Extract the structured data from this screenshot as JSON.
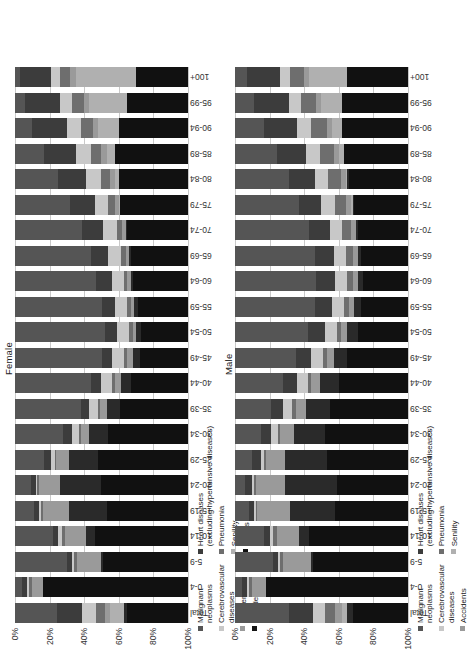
{
  "figure": {
    "panels": [
      {
        "id": "female",
        "title": "Female",
        "yticks": [
          "0%",
          "20%",
          "40%",
          "60%",
          "80%",
          "100%"
        ]
      },
      {
        "id": "male",
        "title": "Male",
        "yticks": [
          "0%",
          "20%",
          "40%",
          "60%",
          "80%",
          "100%"
        ]
      }
    ]
  },
  "legend": {
    "female": {
      "col1": [
        {
          "label": "Malignant\nneoplasms",
          "color": "#555555"
        },
        {
          "label": "Cerebrovascular\ndiseases",
          "color": "#c8c8c8"
        },
        {
          "label": "Accidents",
          "color": "#9a9a9a"
        },
        {
          "label": "Suicide",
          "color": "#141414"
        }
      ],
      "col2": [
        {
          "label": "Heart diseases\n(excluding hypertensive diseases)",
          "color": "#3c3c3c"
        },
        {
          "label": "Pneumonia",
          "color": "#6e6e6e"
        },
        {
          "label": "Senility",
          "color": "#b0b0b0"
        },
        {
          "label": "Others",
          "color": "#111111"
        }
      ]
    },
    "male": {
      "col1": [
        {
          "label": "Malignant\nneoplasms",
          "color": "#555555"
        },
        {
          "label": "Cerebrovascular\ndiseases",
          "color": "#c8c8c8"
        },
        {
          "label": "Accidents",
          "color": "#9a9a9a"
        }
      ],
      "col2": [
        {
          "label": "Heart diseases\n(excluding hypertensive diseases)",
          "color": "#3c3c3c"
        },
        {
          "label": "Pneumonia",
          "color": "#6e6e6e"
        },
        {
          "label": "Senility",
          "color": "#b0b0b0"
        }
      ]
    }
  },
  "chart_data": {
    "type": "bar",
    "subtype": "stacked-percentage",
    "orientation": "vertical-rotated",
    "xlabel": "",
    "ylabel": "",
    "ylim": [
      0,
      100
    ],
    "grid": true,
    "legend_position": "bottom-left",
    "categories": [
      "Total",
      "0-4",
      "5-9",
      "10-14",
      "15-19",
      "20-24",
      "25-29",
      "30-34",
      "35-39",
      "40-44",
      "45-49",
      "50-54",
      "55-59",
      "60-64",
      "65-69",
      "70-74",
      "75-79",
      "80-84",
      "85-89",
      "90-94",
      "95-99",
      "100+"
    ],
    "series_order": [
      "Malignant neoplasms",
      "Heart diseases (excluding hypertensive diseases)",
      "Cerebrovascular diseases",
      "Pneumonia",
      "Accidents",
      "Senility",
      "Suicide",
      "Others"
    ],
    "colors": {
      "Malignant neoplasms": "#555555",
      "Heart diseases (excluding hypertensive diseases)": "#3c3c3c",
      "Cerebrovascular diseases": "#c8c8c8",
      "Pneumonia": "#6e6e6e",
      "Accidents": "#9a9a9a",
      "Senility": "#b0b0b0",
      "Suicide": "#2a2a2a",
      "Others": "#111111"
    },
    "panels": [
      {
        "name": "Female",
        "series": [
          {
            "name": "Malignant neoplasms",
            "values": [
              24.0,
              4.0,
              30.0,
              22.0,
              11.0,
              9.0,
              17.0,
              28.0,
              38.0,
              44.0,
              50.0,
              52.0,
              50.0,
              47.0,
              44.0,
              39.0,
              32.0,
              25.0,
              17.0,
              10.0,
              6.0,
              3.0
            ]
          },
          {
            "name": "Heart diseases (excluding hypertensive diseases)",
            "values": [
              15.0,
              3.0,
              3.0,
              3.0,
              3.0,
              3.0,
              4.0,
              5.0,
              5.0,
              6.0,
              6.0,
              7.0,
              8.0,
              9.0,
              10.0,
              12.0,
              14.0,
              16.0,
              18.0,
              20.0,
              20.0,
              18.0
            ]
          },
          {
            "name": "Cerebrovascular diseases",
            "values": [
              8.0,
              1.0,
              1.0,
              2.0,
              1.0,
              1.0,
              2.0,
              4.0,
              5.0,
              6.0,
              7.0,
              7.0,
              7.0,
              7.0,
              7.0,
              8.0,
              8.0,
              9.0,
              9.0,
              8.0,
              7.0,
              5.0
            ]
          },
          {
            "name": "Pneumonia",
            "values": [
              5.0,
              2.0,
              2.0,
              2.0,
              1.0,
              1.0,
              1.0,
              1.0,
              1.0,
              2.0,
              2.0,
              2.0,
              2.0,
              2.0,
              3.0,
              3.0,
              4.0,
              5.0,
              6.0,
              7.0,
              7.0,
              6.0
            ]
          },
          {
            "name": "Accidents",
            "values": [
              3.0,
              6.0,
              14.0,
              12.0,
              15.0,
              12.0,
              7.0,
              5.0,
              4.0,
              3.0,
              3.0,
              2.0,
              2.0,
              2.0,
              2.0,
              2.0,
              2.0,
              3.0,
              3.0,
              3.0,
              3.0,
              3.0
            ]
          },
          {
            "name": "Senility",
            "values": [
              8.0,
              0.0,
              0.0,
              0.0,
              0.0,
              0.0,
              0.0,
              0.0,
              0.0,
              0.0,
              0.0,
              0.0,
              0.0,
              0.0,
              0.0,
              0.0,
              1.0,
              2.0,
              5.0,
              12.0,
              22.0,
              35.0
            ]
          },
          {
            "name": "Suicide",
            "values": [
              2.0,
              0.0,
              1.0,
              5.0,
              22.0,
              24.0,
              17.0,
              11.0,
              8.0,
              6.0,
              4.0,
              3.0,
              2.0,
              1.0,
              1.0,
              1.0,
              0.0,
              0.0,
              0.0,
              0.0,
              0.0,
              0.0
            ]
          },
          {
            "name": "Others",
            "values": [
              35.0,
              84.0,
              49.0,
              54.0,
              47.0,
              50.0,
              52.0,
              46.0,
              39.0,
              33.0,
              28.0,
              27.0,
              29.0,
              32.0,
              33.0,
              35.0,
              39.0,
              40.0,
              42.0,
              40.0,
              35.0,
              30.0
            ]
          }
        ]
      },
      {
        "name": "Male",
        "series": [
          {
            "name": "Malignant neoplasms",
            "values": [
              31.0,
              4.0,
              22.0,
              17.0,
              8.0,
              6.0,
              10.0,
              15.0,
              21.0,
              28.0,
              35.0,
              42.0,
              46.0,
              47.0,
              46.0,
              43.0,
              37.0,
              31.0,
              24.0,
              17.0,
              11.0,
              7.0
            ]
          },
          {
            "name": "Heart diseases (excluding hypertensive diseases)",
            "values": [
              14.0,
              3.0,
              3.0,
              3.0,
              3.0,
              4.0,
              5.0,
              6.0,
              7.0,
              8.0,
              9.0,
              10.0,
              10.0,
              11.0,
              11.0,
              12.0,
              13.0,
              15.0,
              17.0,
              19.0,
              20.0,
              19.0
            ]
          },
          {
            "name": "Cerebrovascular diseases",
            "values": [
              7.0,
              1.0,
              1.0,
              2.0,
              1.0,
              1.0,
              2.0,
              4.0,
              5.0,
              6.0,
              7.0,
              7.0,
              7.0,
              7.0,
              7.0,
              7.0,
              8.0,
              8.0,
              8.0,
              8.0,
              7.0,
              6.0
            ]
          },
          {
            "name": "Pneumonia",
            "values": [
              6.0,
              2.0,
              2.0,
              2.0,
              1.0,
              1.0,
              1.0,
              1.0,
              2.0,
              2.0,
              2.0,
              2.0,
              3.0,
              3.0,
              4.0,
              5.0,
              6.0,
              7.0,
              8.0,
              9.0,
              9.0,
              8.0
            ]
          },
          {
            "name": "Accidents",
            "values": [
              4.0,
              8.0,
              16.0,
              13.0,
              19.0,
              17.0,
              11.0,
              8.0,
              6.0,
              5.0,
              4.0,
              4.0,
              3.0,
              3.0,
              3.0,
              3.0,
              3.0,
              3.0,
              3.0,
              3.0,
              3.0,
              3.0
            ]
          },
          {
            "name": "Senility",
            "values": [
              3.0,
              0.0,
              0.0,
              0.0,
              0.0,
              0.0,
              0.0,
              0.0,
              0.0,
              0.0,
              0.0,
              0.0,
              0.0,
              0.0,
              0.0,
              0.0,
              1.0,
              1.0,
              3.0,
              6.0,
              12.0,
              22.0
            ]
          },
          {
            "name": "Suicide",
            "values": [
              3.0,
              0.0,
              1.0,
              6.0,
              26.0,
              30.0,
              24.0,
              18.0,
              14.0,
              11.0,
              8.0,
              6.0,
              4.0,
              3.0,
              2.0,
              1.0,
              1.0,
              1.0,
              0.0,
              0.0,
              0.0,
              0.0
            ]
          },
          {
            "name": "Others",
            "values": [
              32.0,
              82.0,
              55.0,
              57.0,
              42.0,
              41.0,
              47.0,
              48.0,
              45.0,
              40.0,
              35.0,
              29.0,
              27.0,
              26.0,
              27.0,
              29.0,
              31.0,
              34.0,
              37.0,
              38.0,
              38.0,
              35.0
            ]
          }
        ]
      }
    ]
  }
}
